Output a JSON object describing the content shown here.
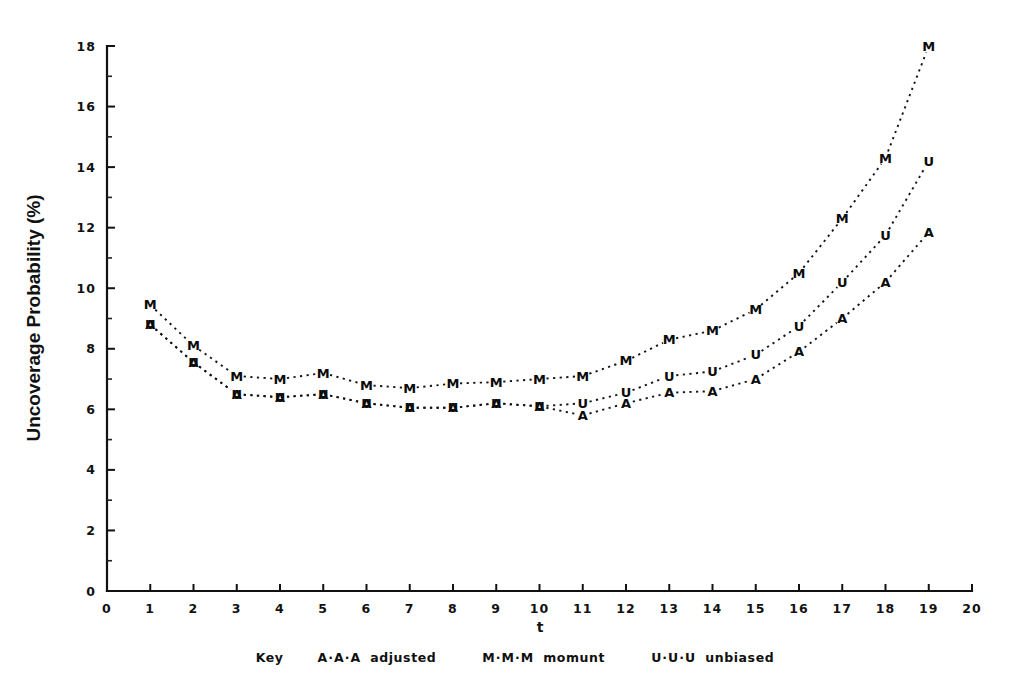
{
  "chart_data": {
    "type": "line",
    "title": "",
    "xlabel": "t",
    "ylabel": "Uncoverage Probability (%)",
    "xlim": [
      0,
      20
    ],
    "ylim": [
      0,
      18
    ],
    "grid": false,
    "legend_position": "bottom",
    "legend_title": "Key",
    "x_ticks": [
      "0",
      "1",
      "2",
      "3",
      "4",
      "5",
      "6",
      "7",
      "8",
      "9",
      "10",
      "11",
      "12",
      "13",
      "14",
      "15",
      "16",
      "17",
      "18",
      "19",
      "20"
    ],
    "y_ticks": [
      "0",
      "2",
      "4",
      "6",
      "8",
      "10",
      "12",
      "14",
      "16",
      "18"
    ],
    "y_minor_ticks": [
      1,
      3,
      5,
      7,
      9,
      11,
      13,
      15,
      17
    ],
    "x": [
      1,
      2,
      3,
      4,
      5,
      6,
      7,
      8,
      9,
      10,
      11,
      12,
      13,
      14,
      15,
      16,
      17,
      18,
      19
    ],
    "series": [
      {
        "name": "moment",
        "marker": "M",
        "legend_symbol": "M·M·M",
        "values": [
          9.45,
          8.1,
          7.1,
          7.0,
          7.2,
          6.8,
          6.7,
          6.85,
          6.9,
          7.0,
          7.1,
          7.6,
          8.3,
          8.6,
          9.3,
          10.5,
          12.3,
          14.3,
          18.0
        ]
      },
      {
        "name": "unbiased",
        "marker": "U",
        "legend_symbol": "U·U·U",
        "values": [
          8.8,
          7.55,
          6.5,
          6.4,
          6.5,
          6.2,
          6.05,
          6.05,
          6.2,
          6.1,
          6.2,
          6.55,
          7.1,
          7.25,
          7.8,
          8.75,
          10.2,
          11.75,
          14.2
        ]
      },
      {
        "name": "adjusted",
        "marker": "A",
        "legend_symbol": "A·A·A",
        "values": [
          8.8,
          7.55,
          6.5,
          6.4,
          6.5,
          6.2,
          6.05,
          6.05,
          6.2,
          6.1,
          5.8,
          6.2,
          6.55,
          6.6,
          7.0,
          7.9,
          9.0,
          10.2,
          11.85
        ]
      }
    ]
  },
  "axes": {
    "y_title": "Uncoverage Probability (%)",
    "x_title": "t"
  },
  "legend": {
    "key_label": "Key",
    "entries": [
      {
        "symbol": "A·A·A",
        "label": "adjusted"
      },
      {
        "symbol": "M·M·M",
        "label": "momunt"
      },
      {
        "symbol": "U·U·U",
        "label": "unbiased"
      }
    ]
  },
  "colors": {
    "ink": "#111111",
    "background": "#ffffff"
  }
}
